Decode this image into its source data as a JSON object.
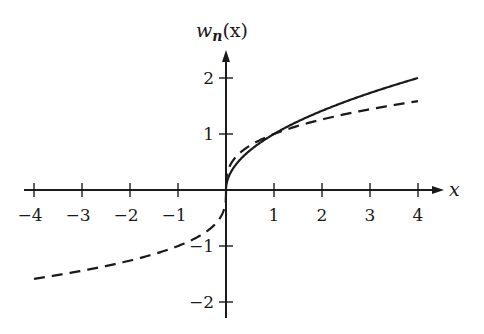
{
  "chart_data": {
    "type": "line",
    "title": "",
    "xlabel": "x",
    "ylabel": "w_n(x)",
    "xlim": [
      -4,
      4
    ],
    "ylim": [
      -2,
      2
    ],
    "grid": false,
    "legend": null,
    "x_ticks": [
      -4,
      -3,
      -2,
      -1,
      1,
      2,
      3,
      4
    ],
    "y_ticks": [
      -2,
      -1,
      1,
      2
    ],
    "series": [
      {
        "name": "solid",
        "style": "solid",
        "x": [
          0,
          0.25,
          0.5,
          1,
          1.5,
          2,
          2.5,
          3,
          3.5,
          4
        ],
        "values": [
          0,
          0.5,
          0.71,
          1.0,
          1.22,
          1.41,
          1.58,
          1.73,
          1.87,
          2.0
        ]
      },
      {
        "name": "dashed",
        "style": "dashed",
        "x": [
          -4,
          -3,
          -2,
          -1,
          -0.5,
          -0.1,
          0,
          0.1,
          0.5,
          1,
          2,
          3,
          4
        ],
        "values": [
          -1.59,
          -1.44,
          -1.26,
          -1.0,
          -0.79,
          -0.46,
          0,
          0.46,
          0.79,
          1.0,
          1.26,
          1.44,
          1.59
        ]
      }
    ]
  },
  "labels": {
    "x_axis": "x",
    "y_axis_main": "w",
    "y_axis_sub": "n",
    "y_axis_arg": "(x)",
    "x_ticks": [
      "−4",
      "−3",
      "−2",
      "−1",
      "1",
      "2",
      "3",
      "4"
    ],
    "y_ticks": [
      "2",
      "1",
      "−1",
      "−2"
    ]
  }
}
